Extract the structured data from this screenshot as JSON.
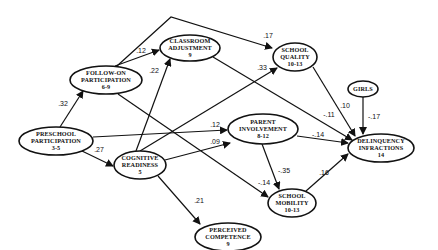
{
  "diagram": {
    "type": "path-model",
    "nodes": [
      {
        "id": "preschool",
        "lines": [
          "PRESCHOOL",
          "PARTICIPATION",
          "3-5"
        ]
      },
      {
        "id": "followon",
        "lines": [
          "FOLLOW-ON",
          "PARTICIPATION",
          "6-9"
        ]
      },
      {
        "id": "classroom",
        "lines": [
          "CLASSROOM",
          "ADJUSTMENT",
          "9"
        ]
      },
      {
        "id": "quality",
        "lines": [
          "SCHOOL",
          "QUALITY",
          "10-13"
        ]
      },
      {
        "id": "girls",
        "lines": [
          "GIRLS"
        ]
      },
      {
        "id": "cognitive",
        "lines": [
          "COGNITIVE",
          "READINESS",
          "5"
        ]
      },
      {
        "id": "parent",
        "lines": [
          "PARENT",
          "INVOLVEMENT",
          "8-12"
        ]
      },
      {
        "id": "delinquency",
        "lines": [
          "DELINQUENCY",
          "INFRACTIONS",
          "14"
        ]
      },
      {
        "id": "mobility",
        "lines": [
          "SCHOOL",
          "MOBILITY",
          "10-13"
        ]
      },
      {
        "id": "competence",
        "lines": [
          "PERCEIVED",
          "COMPETENCE",
          "9"
        ]
      }
    ],
    "edges": [
      {
        "from": "preschool",
        "to": "followon",
        "coef": ".32"
      },
      {
        "from": "preschool",
        "to": "cognitive",
        "coef": ".27"
      },
      {
        "from": "preschool",
        "to": "parent",
        "coef": ".12"
      },
      {
        "from": "followon",
        "to": "classroom",
        "coef": ".12"
      },
      {
        "from": "followon",
        "to": "quality",
        "coef": ".17"
      },
      {
        "from": "followon",
        "to": "mobility",
        "coef": "-.14"
      },
      {
        "from": "cognitive",
        "to": "classroom",
        "coef": ".22"
      },
      {
        "from": "cognitive",
        "to": "quality",
        "coef": ".33"
      },
      {
        "from": "cognitive",
        "to": "parent",
        "coef": ".09"
      },
      {
        "from": "cognitive",
        "to": "competence",
        "coef": ".21"
      },
      {
        "from": "classroom",
        "to": "delinquency",
        "coef": "-.11"
      },
      {
        "from": "quality",
        "to": "delinquency",
        "coef": ".10"
      },
      {
        "from": "girls",
        "to": "delinquency",
        "coef": "-.17"
      },
      {
        "from": "parent",
        "to": "delinquency",
        "coef": "-.14"
      },
      {
        "from": "parent",
        "to": "mobility",
        "coef": "-.35"
      },
      {
        "from": "mobility",
        "to": "delinquency",
        "coef": ".16"
      }
    ]
  }
}
